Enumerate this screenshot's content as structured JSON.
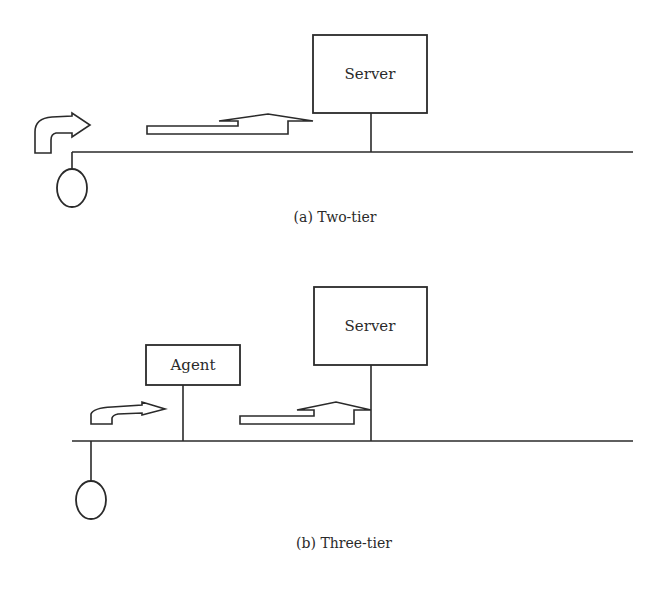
{
  "figure": {
    "panels": [
      {
        "id": "a",
        "caption": "(a) Two-tier",
        "nodes": [
          {
            "type": "client",
            "shape": "circle"
          },
          {
            "type": "server",
            "label": "Server"
          }
        ],
        "arrows": [
          {
            "type": "curved-arrow",
            "from": "client",
            "direction": "right"
          },
          {
            "type": "return-arrow",
            "toward": "server"
          }
        ]
      },
      {
        "id": "b",
        "caption": "(b) Three-tier",
        "nodes": [
          {
            "type": "client",
            "shape": "circle"
          },
          {
            "type": "agent",
            "label": "Agent"
          },
          {
            "type": "server",
            "label": "Server"
          }
        ],
        "arrows": [
          {
            "type": "curved-arrow",
            "from": "client",
            "toward": "agent"
          },
          {
            "type": "return-arrow",
            "toward": "server"
          }
        ]
      }
    ],
    "colors": {
      "stroke": "#2a2a2a",
      "background": "#ffffff"
    }
  }
}
